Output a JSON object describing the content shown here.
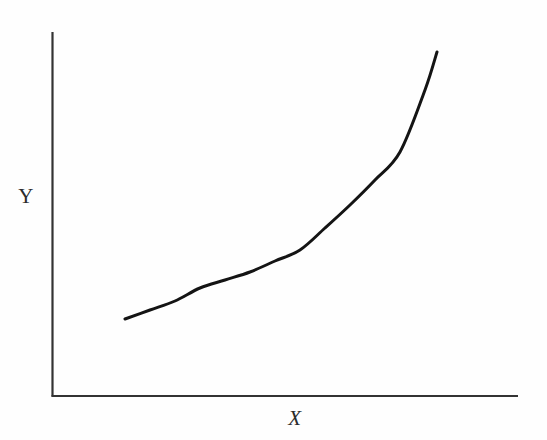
{
  "figure": {
    "background_color": "#fefefe",
    "ink_color": "#1c1c1c",
    "axis_color": "#333333"
  },
  "labels": {
    "x_axis": "X",
    "y_axis": "Y"
  },
  "chart_data": {
    "type": "line",
    "title": "",
    "subtitle": "",
    "xlabel": "X",
    "ylabel": "Y",
    "grid": false,
    "legend": false,
    "legend_position": "none",
    "axis_ticks": {
      "x": [],
      "y": []
    },
    "axis_tick_labels": {
      "x": [],
      "y": []
    },
    "xlim": [
      0,
      1
    ],
    "ylim": [
      0,
      1
    ],
    "series": [
      {
        "name": "curve",
        "color": "#141414",
        "line_width": 3,
        "x": [
          0.157,
          0.211,
          0.264,
          0.318,
          0.372,
          0.425,
          0.479,
          0.533,
          0.587,
          0.64,
          0.694,
          0.748,
          0.801,
          0.826
        ],
        "y": [
          0.212,
          0.236,
          0.261,
          0.286,
          0.313,
          0.343,
          0.379,
          0.425,
          0.486,
          0.566,
          0.67,
          0.802,
          0.92,
          0.945
        ],
        "points_px": [
          [
            125,
            319
          ],
          [
            150,
            310
          ],
          [
            175,
            301
          ],
          [
            200,
            288
          ],
          [
            225,
            280
          ],
          [
            250,
            272
          ],
          [
            275,
            261
          ],
          [
            300,
            250
          ],
          [
            325,
            228
          ],
          [
            350,
            205
          ],
          [
            375,
            180
          ],
          [
            400,
            152
          ],
          [
            425,
            90
          ],
          [
            437,
            52
          ]
        ]
      }
    ]
  },
  "geometry": {
    "y_axis_x": 52,
    "y_axis_top": 32,
    "y_axis_bottom": 396,
    "x_axis_y": 396,
    "x_axis_left": 52,
    "x_axis_right": 518
  }
}
